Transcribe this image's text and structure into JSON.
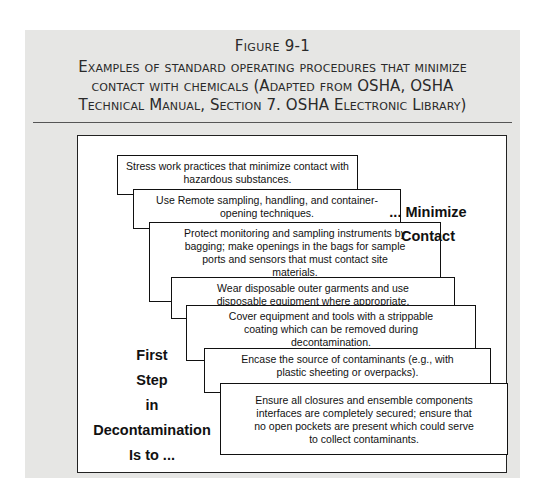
{
  "figure": {
    "number": "Figure 9-1",
    "caption_lines": [
      "Examples of standard operating procedures that minimize",
      "contact with chemicals (Adapted from OSHA, OSHA",
      "Technical Manual, Section 7. OSHA Electronic Library)"
    ]
  },
  "diagram": {
    "left_label": [
      "First",
      "Step",
      "in",
      "Decontamination",
      "Is to ..."
    ],
    "right_label": [
      "... Minimize",
      "Contact"
    ],
    "steps": [
      {
        "lines": [
          "Stress work practices that minimize contact with",
          "hazardous substances."
        ]
      },
      {
        "lines": [
          "Use Remote sampling, handling, and container-",
          "opening techniques."
        ]
      },
      {
        "lines": [
          "Protect monitoring and sampling instruments by",
          "bagging; make openings in the bags for sample",
          "ports and sensors that must contact site",
          "materials."
        ]
      },
      {
        "lines": [
          "Wear disposable outer garments and use",
          "disposable equipment where appropriate."
        ]
      },
      {
        "lines": [
          "Cover equipment and tools with a strippable",
          "coating which can be removed during",
          "decontamination."
        ]
      },
      {
        "lines": [
          "Encase the source of contaminants (e.g., with",
          "plastic sheeting or overpacks)."
        ]
      },
      {
        "lines": [
          "Ensure all closures and ensemble components",
          "interfaces are completely secured; ensure that",
          "no open pockets are present which could serve",
          "to collect contaminants."
        ]
      }
    ]
  },
  "colors": {
    "panel_background": "#e6e6e4",
    "frame_background": "#ffffff",
    "text": "#111111"
  }
}
